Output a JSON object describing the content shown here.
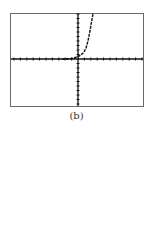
{
  "figure": {
    "caption": "(b)"
  },
  "chart_data": {
    "type": "line",
    "title": "",
    "xlabel": "",
    "ylabel": "",
    "x_ticks_left_of_origin": 10,
    "x_ticks_right_of_origin": 10,
    "y_ticks_above_origin": 10,
    "y_ticks_below_origin": 10,
    "grid": false,
    "legend": null,
    "series": [
      {
        "name": "curve",
        "points_approx": [
          [
            -4,
            0.05
          ],
          [
            -2,
            0.2
          ],
          [
            -1,
            0.4
          ],
          [
            0,
            1
          ],
          [
            1,
            2.5
          ],
          [
            2,
            5
          ],
          [
            2.8,
            8
          ],
          [
            3.3,
            10
          ]
        ]
      }
    ],
    "caption": "(b)"
  }
}
